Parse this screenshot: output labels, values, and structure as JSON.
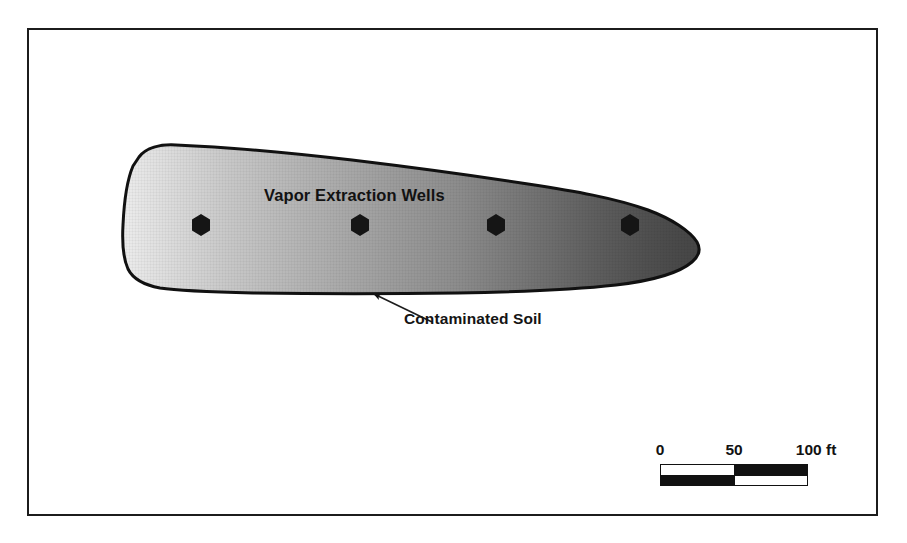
{
  "figure": {
    "type": "plan-view-diagram",
    "background_color": "#ffffff",
    "frame_color": "#1c1c1c"
  },
  "labels": {
    "wells_label": "Vapor Extraction Wells",
    "soil_label": "Contaminated Soil"
  },
  "plume": {
    "name": "contaminated-soil-plume",
    "outline_color": "#111111",
    "gradient_light": "#e2e2e2",
    "gradient_mid": "#9a9a9a",
    "gradient_dark": "#454545"
  },
  "wells": [
    {
      "id": "well-1",
      "cx": 201,
      "cy": 225
    },
    {
      "id": "well-2",
      "cx": 360,
      "cy": 225
    },
    {
      "id": "well-3",
      "cx": 496,
      "cy": 225
    },
    {
      "id": "well-4",
      "cx": 630,
      "cy": 225
    }
  ],
  "leader": {
    "name": "contaminated-soil-leader-line",
    "from_x": 432,
    "from_y": 322,
    "to_x": 372,
    "to_y": 292
  },
  "scale": {
    "name": "map-scale-bar",
    "unit": "ft",
    "ticks": [
      {
        "value": "0",
        "pos_pct": 3
      },
      {
        "value": "50",
        "pos_pct": 50
      },
      {
        "value": "100 ft",
        "pos_pct": 97
      }
    ],
    "segments_top": [
      "white",
      "black"
    ],
    "segments_bottom": [
      "black",
      "white"
    ],
    "bar_color": "#111111"
  }
}
